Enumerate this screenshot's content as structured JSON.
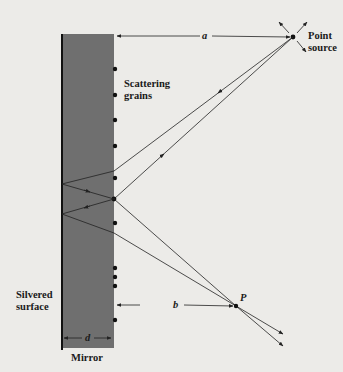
{
  "figure": {
    "labels": {
      "point_source": [
        "Point",
        "source"
      ],
      "scattering_grains": [
        "Scattering",
        "grains"
      ],
      "silvered_surface": [
        "Silvered",
        "surface"
      ],
      "mirror": "Mirror",
      "a": "a",
      "b": "b",
      "d": "d",
      "P": "P"
    },
    "colors": {
      "mirror_fill": "#6f6f6f",
      "line": "#222222",
      "background": "#ecebe8"
    },
    "geometry": {
      "mirror": {
        "left": 61,
        "right": 114,
        "top": 34,
        "bottom": 348
      },
      "point_source": [
        293,
        37
      ],
      "point_P": [
        236,
        306
      ],
      "grain_x": 115,
      "grain_ys": [
        69,
        95,
        120,
        146,
        178,
        223,
        268,
        277,
        286,
        320
      ],
      "scatter_grain": [
        114,
        199
      ]
    }
  }
}
